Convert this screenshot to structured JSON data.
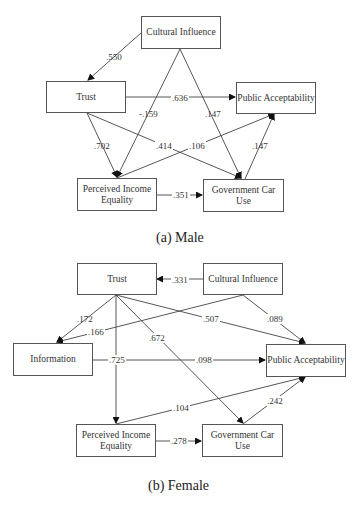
{
  "male": {
    "caption": "(a) Male",
    "nodes": {
      "cultural_influence": "Cultural Influence",
      "trust": "Trust",
      "public_acceptability": "Public Acceptability",
      "perceived_income_equality": "Perceived Income Equality",
      "government_car_use": "Government Car Use"
    },
    "paths": {
      "ci_trust": ".550",
      "trust_pa": ".636",
      "ci_pie": "-.159",
      "ci_gcu": ".147",
      "trust_pie": ".702",
      "trust_gcu": ".414",
      "pie_pa": ".106",
      "gcu_pa": ".147",
      "pie_gcu": ".351"
    }
  },
  "female": {
    "caption": "(b) Female",
    "nodes": {
      "trust": "Trust",
      "cultural_influence": "Cultural Influence",
      "information": "Information",
      "public_acceptability": "Public Acceptability",
      "perceived_income_equality": "Perceived Income Equality",
      "government_car_use": "Government Car Use"
    },
    "paths": {
      "ci_trust": ".331",
      "trust_info": ".172",
      "ci_info": ".166",
      "trust_pa": ".507",
      "ci_pa": ".089",
      "trust_gcu": ".672",
      "trust_pie": ".725",
      "info_pa": ".098",
      "pie_pa": ".104",
      "gcu_pa": ".242",
      "pie_gcu": ".278"
    }
  }
}
